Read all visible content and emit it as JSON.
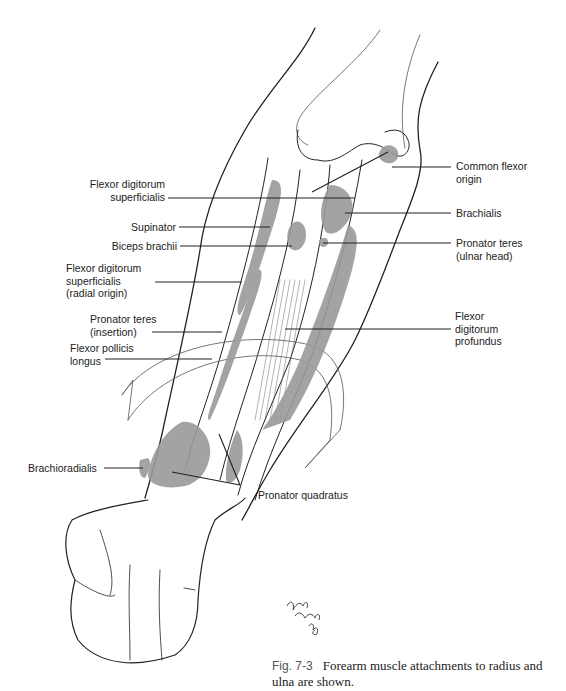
{
  "figure": {
    "number": "Fig. 7-3",
    "caption": "Forearm muscle attachments to radius and ulna are shown.",
    "signature": "signature-mark"
  },
  "labels": {
    "left": [
      {
        "id": "fds",
        "line1": "Flexor digitorum",
        "line2": "superficialis"
      },
      {
        "id": "supinator",
        "line1": "Supinator"
      },
      {
        "id": "biceps",
        "line1": "Biceps brachii"
      },
      {
        "id": "fds_radial",
        "line1": "Flexor digitorum",
        "line2": "superficialis",
        "line3": "(radial origin)"
      },
      {
        "id": "pt_insertion",
        "line1": "Pronator teres",
        "line2": "(insertion)"
      },
      {
        "id": "fpl",
        "line1": "Flexor pollicis",
        "line2": "longus"
      },
      {
        "id": "brachioradialis",
        "line1": "Brachioradialis"
      }
    ],
    "right": [
      {
        "id": "common_flexor",
        "line1": "Common flexor",
        "line2": "origin"
      },
      {
        "id": "brachialis",
        "line1": "Brachialis"
      },
      {
        "id": "pt_ulnar",
        "line1": "Pronator teres",
        "line2": "(ulnar head)"
      },
      {
        "id": "fdp",
        "line1": "Flexor",
        "line2": "digitorum",
        "line3": "profundus"
      }
    ],
    "bottom": [
      {
        "id": "pronator_quadratus",
        "line1": "Pronator quadratus"
      }
    ]
  },
  "colors": {
    "muscle_fill": "#9a9a9a",
    "ink": "#222222",
    "background": "#ffffff"
  }
}
